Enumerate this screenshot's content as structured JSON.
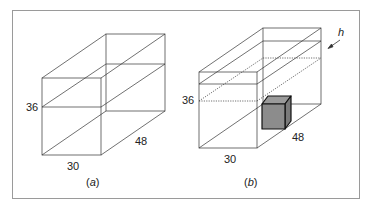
{
  "figure": {
    "panel_a": {
      "caption_open": "(",
      "caption_letter": "a",
      "caption_close": ")",
      "label_height": "36",
      "label_width": "30",
      "label_depth": "48"
    },
    "panel_b": {
      "caption_open": "(",
      "caption_letter": "b",
      "caption_close": ")",
      "label_height": "36",
      "label_width": "30",
      "label_depth": "48",
      "label_rise": "h"
    },
    "colors": {
      "line": "#333333",
      "border": "#999999",
      "cube_fill": "#8c8c8c",
      "cube_top": "#9a9a9a",
      "cube_side": "#7a7a7a"
    }
  }
}
